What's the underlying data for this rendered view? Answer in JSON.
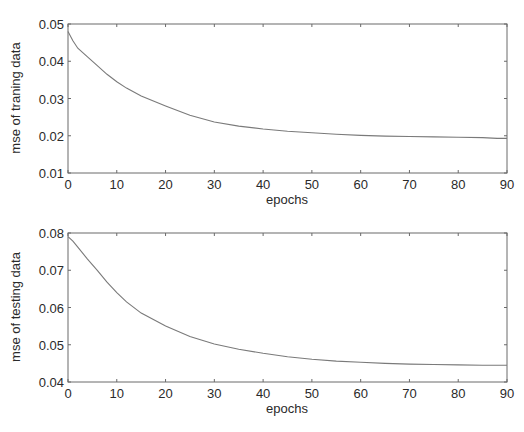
{
  "figure": {
    "panels": [
      {
        "id": "training",
        "ylabel": "mse of traning data",
        "xlabel": "epochs"
      },
      {
        "id": "testing",
        "ylabel": "mse of testing data",
        "xlabel": "epochs"
      }
    ]
  },
  "chart_data": [
    {
      "type": "line",
      "title": "",
      "xlabel": "epochs",
      "ylabel": "mse of traning data",
      "xlim": [
        0,
        90
      ],
      "ylim": [
        0.01,
        0.05
      ],
      "xticks": [
        0,
        10,
        20,
        30,
        40,
        50,
        60,
        70,
        80,
        90
      ],
      "yticks": [
        0.01,
        0.02,
        0.03,
        0.04,
        0.05
      ],
      "ytick_labels": [
        "0.01",
        "0.02",
        "0.03",
        "0.04",
        "0.05"
      ],
      "grid": false,
      "legend": null,
      "series": [
        {
          "name": "training mse",
          "x": [
            0,
            1,
            2,
            4,
            6,
            8,
            10,
            12,
            15,
            20,
            25,
            30,
            35,
            40,
            45,
            50,
            55,
            60,
            65,
            70,
            75,
            80,
            85,
            88,
            90
          ],
          "y": [
            0.048,
            0.0455,
            0.0435,
            0.0412,
            0.0388,
            0.0365,
            0.0345,
            0.0328,
            0.0307,
            0.028,
            0.0255,
            0.0237,
            0.0226,
            0.0218,
            0.0212,
            0.0208,
            0.0204,
            0.0201,
            0.0199,
            0.0198,
            0.0197,
            0.0196,
            0.0195,
            0.0193,
            0.0193
          ]
        }
      ]
    },
    {
      "type": "line",
      "title": "",
      "xlabel": "epochs",
      "ylabel": "mse of testing data",
      "xlim": [
        0,
        90
      ],
      "ylim": [
        0.04,
        0.08
      ],
      "xticks": [
        0,
        10,
        20,
        30,
        40,
        50,
        60,
        70,
        80,
        90
      ],
      "yticks": [
        0.04,
        0.05,
        0.06,
        0.07,
        0.08
      ],
      "ytick_labels": [
        "0.04",
        "0.05",
        "0.06",
        "0.07",
        "0.08"
      ],
      "grid": false,
      "legend": null,
      "series": [
        {
          "name": "testing mse",
          "x": [
            0,
            1,
            2,
            4,
            6,
            8,
            10,
            12,
            15,
            20,
            25,
            30,
            35,
            40,
            45,
            50,
            55,
            60,
            65,
            70,
            75,
            80,
            85,
            90
          ],
          "y": [
            0.079,
            0.0778,
            0.0762,
            0.073,
            0.07,
            0.0668,
            0.064,
            0.0615,
            0.0585,
            0.055,
            0.0522,
            0.0502,
            0.0488,
            0.0477,
            0.0468,
            0.0461,
            0.0456,
            0.0453,
            0.045,
            0.0448,
            0.0447,
            0.0446,
            0.0445,
            0.0445
          ]
        }
      ]
    }
  ]
}
